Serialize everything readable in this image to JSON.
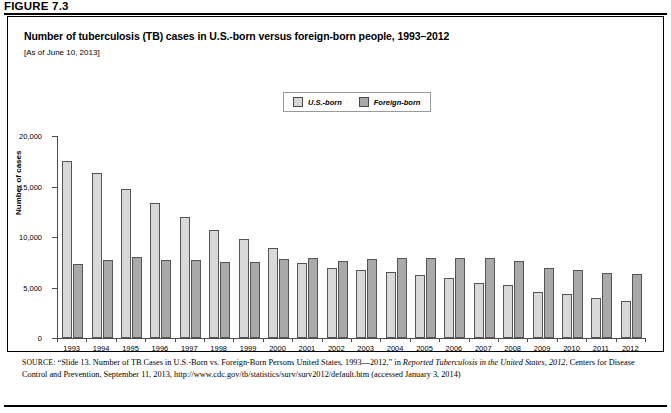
{
  "figure": {
    "label": "FIGURE 7.3"
  },
  "chart": {
    "title": "Number of tuberculosis (TB) cases in U.S.-born versus foreign-born people, 1993–2012",
    "subtitle": "[As of June 10, 2013]",
    "ylabel": "Number of cases"
  },
  "legend": {
    "items": [
      {
        "label": "U.S.-born",
        "color": "#d9d9d9"
      },
      {
        "label": "Foreign-born",
        "color": "#a9a9a9"
      }
    ]
  },
  "source": {
    "prefix": "SOURCE:",
    "part1": " “Slide 13. Number of TB Cases in U.S.-Born vs. Foreign-Born Persons United States, 1993—2012,” in ",
    "italic1": "Reported Tuberculosis in the United States, 2012",
    "part2": ", Centers for Disease Control and Prevention, September 11, 2013, http://www.cdc.gov/tb/statistics/surv/surv2012/default.htm (accessed January 3, 2014)"
  },
  "chart_data": {
    "type": "bar",
    "title": "Number of tuberculosis (TB) cases in U.S.-born versus foreign-born people, 1993–2012",
    "subtitle": "[As of June 10, 2013]",
    "xlabel": "",
    "ylabel": "Number of cases",
    "ylim": [
      0,
      20000
    ],
    "yticks": [
      0,
      5000,
      10000,
      15000,
      20000
    ],
    "ytick_labels": [
      "0",
      "5,000",
      "10,000",
      "15,000",
      "20,000"
    ],
    "grid": false,
    "legend_position": "top-center",
    "categories": [
      "1993",
      "1994",
      "1995",
      "1996",
      "1997",
      "1998",
      "1999",
      "2000",
      "2001",
      "2002",
      "2003",
      "2004",
      "2005",
      "2006",
      "2007",
      "2008",
      "2009",
      "2010",
      "2011",
      "2012"
    ],
    "series": [
      {
        "name": "U.S.-born",
        "color": "#d9d9d9",
        "values": [
          17500,
          16300,
          14800,
          13400,
          12000,
          10700,
          9800,
          8900,
          7400,
          6900,
          6700,
          6500,
          6200,
          5900,
          5400,
          5200,
          4600,
          4400,
          4000,
          3700
        ]
      },
      {
        "name": "Foreign-born",
        "color": "#a9a9a9",
        "values": [
          7300,
          7700,
          8000,
          7700,
          7700,
          7500,
          7500,
          7800,
          7900,
          7600,
          7800,
          7900,
          7900,
          7900,
          7900,
          7600,
          6900,
          6700,
          6400,
          6300
        ]
      }
    ]
  }
}
